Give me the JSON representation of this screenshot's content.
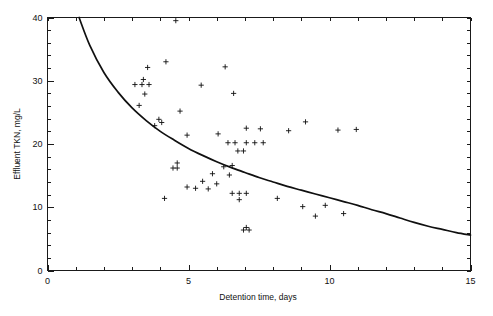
{
  "chart_data": {
    "type": "scatter",
    "title": "",
    "xlabel": "Detention time, days",
    "ylabel": "Effluent TKN, mg/L",
    "xlim": [
      0,
      15
    ],
    "ylim": [
      0,
      40
    ],
    "xticks": [
      0,
      5,
      10,
      15
    ],
    "xtick_labels": [
      "0",
      "5",
      "10",
      "15"
    ],
    "yticks": [
      0,
      10,
      20,
      30,
      40
    ],
    "ytick_labels": [
      "0",
      "10",
      "20",
      "30",
      "40"
    ],
    "x_minor_tick_step": 1,
    "y_minor_tick_step": 2,
    "grid": false,
    "legend": null,
    "marker": "plus",
    "marker_color": "#101010",
    "curve_color": "#101010",
    "points": [
      {
        "x": 4.55,
        "y": 39.5
      },
      {
        "x": 3.55,
        "y": 32.1
      },
      {
        "x": 4.2,
        "y": 33.0
      },
      {
        "x": 6.3,
        "y": 32.2
      },
      {
        "x": 3.4,
        "y": 30.2
      },
      {
        "x": 3.1,
        "y": 29.4
      },
      {
        "x": 3.35,
        "y": 29.4
      },
      {
        "x": 3.6,
        "y": 29.4
      },
      {
        "x": 5.45,
        "y": 29.3
      },
      {
        "x": 6.6,
        "y": 28.0
      },
      {
        "x": 3.45,
        "y": 27.9
      },
      {
        "x": 3.25,
        "y": 26.1
      },
      {
        "x": 4.7,
        "y": 25.2
      },
      {
        "x": 3.95,
        "y": 23.9
      },
      {
        "x": 3.8,
        "y": 22.9
      },
      {
        "x": 4.05,
        "y": 23.4
      },
      {
        "x": 4.95,
        "y": 21.4
      },
      {
        "x": 6.05,
        "y": 21.6
      },
      {
        "x": 9.15,
        "y": 23.5
      },
      {
        "x": 10.3,
        "y": 22.2
      },
      {
        "x": 10.95,
        "y": 22.3
      },
      {
        "x": 7.05,
        "y": 22.5
      },
      {
        "x": 7.55,
        "y": 22.4
      },
      {
        "x": 8.55,
        "y": 22.1
      },
      {
        "x": 6.4,
        "y": 20.2
      },
      {
        "x": 6.65,
        "y": 20.2
      },
      {
        "x": 7.05,
        "y": 20.2
      },
      {
        "x": 7.35,
        "y": 20.2
      },
      {
        "x": 7.65,
        "y": 20.2
      },
      {
        "x": 6.75,
        "y": 18.9
      },
      {
        "x": 6.95,
        "y": 18.9
      },
      {
        "x": 4.6,
        "y": 17.0
      },
      {
        "x": 4.45,
        "y": 16.2
      },
      {
        "x": 4.6,
        "y": 16.2
      },
      {
        "x": 6.25,
        "y": 16.4
      },
      {
        "x": 6.55,
        "y": 16.6
      },
      {
        "x": 5.85,
        "y": 15.3
      },
      {
        "x": 6.45,
        "y": 15.1
      },
      {
        "x": 5.5,
        "y": 14.1
      },
      {
        "x": 6.0,
        "y": 13.7
      },
      {
        "x": 4.95,
        "y": 13.2
      },
      {
        "x": 5.25,
        "y": 13.0
      },
      {
        "x": 5.7,
        "y": 12.9
      },
      {
        "x": 6.55,
        "y": 12.2
      },
      {
        "x": 6.8,
        "y": 12.2
      },
      {
        "x": 7.05,
        "y": 12.2
      },
      {
        "x": 6.8,
        "y": 11.2
      },
      {
        "x": 4.15,
        "y": 11.4
      },
      {
        "x": 8.15,
        "y": 11.4
      },
      {
        "x": 9.05,
        "y": 10.1
      },
      {
        "x": 9.85,
        "y": 10.3
      },
      {
        "x": 10.5,
        "y": 9.0
      },
      {
        "x": 9.5,
        "y": 8.6
      },
      {
        "x": 6.95,
        "y": 6.4
      },
      {
        "x": 7.15,
        "y": 6.4
      },
      {
        "x": 7.05,
        "y": 6.8
      }
    ],
    "fit_curve": {
      "description": "decaying regression curve through scatter",
      "points": [
        {
          "x": 1.12,
          "y": 40.0
        },
        {
          "x": 1.5,
          "y": 35.6
        },
        {
          "x": 2.0,
          "y": 31.3
        },
        {
          "x": 2.5,
          "y": 28.2
        },
        {
          "x": 3.0,
          "y": 25.7
        },
        {
          "x": 3.5,
          "y": 23.7
        },
        {
          "x": 4.0,
          "y": 22.0
        },
        {
          "x": 4.5,
          "y": 20.6
        },
        {
          "x": 5.0,
          "y": 19.3
        },
        {
          "x": 5.5,
          "y": 18.2
        },
        {
          "x": 6.0,
          "y": 17.2
        },
        {
          "x": 6.5,
          "y": 16.3
        },
        {
          "x": 7.0,
          "y": 15.5
        },
        {
          "x": 7.5,
          "y": 14.7
        },
        {
          "x": 8.0,
          "y": 14.0
        },
        {
          "x": 8.5,
          "y": 13.3
        },
        {
          "x": 9.0,
          "y": 12.7
        },
        {
          "x": 9.5,
          "y": 12.1
        },
        {
          "x": 10.0,
          "y": 11.5
        },
        {
          "x": 10.5,
          "y": 10.9
        },
        {
          "x": 11.0,
          "y": 10.3
        },
        {
          "x": 11.5,
          "y": 9.6
        },
        {
          "x": 12.0,
          "y": 9.0
        },
        {
          "x": 12.5,
          "y": 8.3
        },
        {
          "x": 13.0,
          "y": 7.6
        },
        {
          "x": 13.5,
          "y": 7.0
        },
        {
          "x": 14.0,
          "y": 6.5
        },
        {
          "x": 14.5,
          "y": 6.0
        },
        {
          "x": 15.0,
          "y": 5.6
        }
      ]
    }
  }
}
